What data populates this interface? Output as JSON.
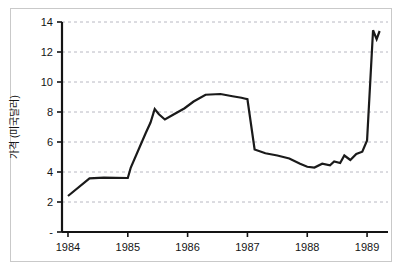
{
  "chart_data": {
    "type": "line",
    "title": "",
    "subtitle": "",
    "xlabel": "",
    "ylabel": "가격 (미국달러)",
    "xlim": [
      1983.9,
      1989.35
    ],
    "ylim": [
      0,
      14
    ],
    "grid": true,
    "grid_style": "dashed-horizontal",
    "legend": "none",
    "line_color": "#1a1a1a",
    "line_width": 2.2,
    "background_color": "#ffffff",
    "frame_color": "#c9c9c9",
    "xticks": [
      1984,
      1985,
      1986,
      1987,
      1988,
      1989
    ],
    "xtick_labels": [
      "1984",
      "1985",
      "1986",
      "1987",
      "1988",
      "1989"
    ],
    "yticks": [
      0,
      2,
      4,
      6,
      8,
      10,
      12,
      14
    ],
    "ytick_labels": [
      "-",
      "2",
      "4",
      "6",
      "8",
      "10",
      "12",
      "14"
    ],
    "series": [
      {
        "name": "가격",
        "x": [
          1984.0,
          1984.36,
          1984.6,
          1985.0,
          1985.05,
          1985.3,
          1985.38,
          1985.45,
          1985.52,
          1985.62,
          1985.75,
          1985.95,
          1986.1,
          1986.3,
          1986.55,
          1986.75,
          1986.9,
          1986.95,
          1987.0,
          1987.12,
          1987.3,
          1987.5,
          1987.7,
          1987.88,
          1988.0,
          1988.12,
          1988.25,
          1988.38,
          1988.45,
          1988.55,
          1988.62,
          1988.72,
          1988.82,
          1988.92,
          1989.0,
          1989.1,
          1989.16,
          1989.21
        ],
        "y": [
          2.4,
          3.58,
          3.62,
          3.6,
          4.3,
          6.6,
          7.3,
          8.2,
          7.85,
          7.5,
          7.8,
          8.25,
          8.7,
          9.15,
          9.2,
          9.05,
          8.95,
          8.9,
          8.85,
          5.5,
          5.25,
          5.1,
          4.9,
          4.55,
          4.35,
          4.3,
          4.55,
          4.45,
          4.7,
          4.6,
          5.1,
          4.8,
          5.2,
          5.35,
          6.1,
          13.45,
          12.85,
          13.4
        ]
      }
    ]
  },
  "axis_label": {
    "y_title": "가격 (미국달러)"
  }
}
